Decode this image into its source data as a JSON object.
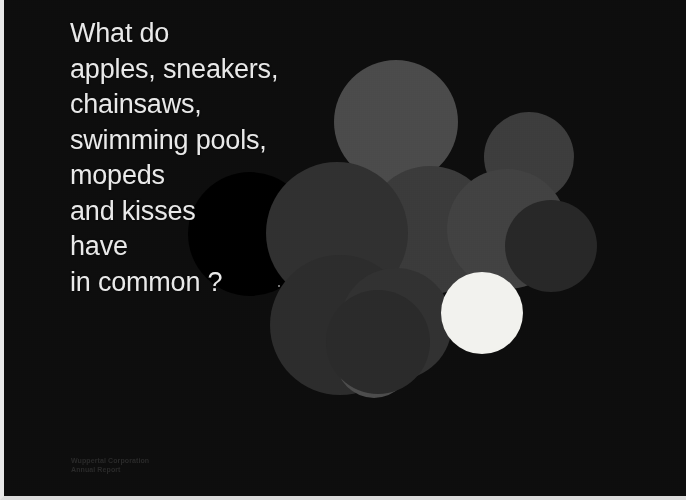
{
  "slide": {
    "background_color": "#0d0d0d",
    "border_color": "#e8e8e8",
    "headline": {
      "color": "#e9e9e9",
      "lines": [
        "What do",
        "apples, sneakers,",
        "chainsaws,",
        "swimming pools,",
        "mopeds",
        "and kisses",
        "have",
        "in common ?"
      ]
    },
    "credit": {
      "color": "#2a2a2a",
      "lines": [
        "Wuppertal Corporation",
        "Annual Report"
      ]
    },
    "bubbles": [
      {
        "name": "bubble-large-top-gray",
        "x": 330,
        "y": 60,
        "size": 124,
        "color": "#4a4a4a"
      },
      {
        "name": "bubble-upper-right-gray",
        "x": 480,
        "y": 112,
        "size": 90,
        "color": "#3c3c3c"
      },
      {
        "name": "bubble-center-gray",
        "x": 362,
        "y": 166,
        "size": 128,
        "color": "#3a3a3a"
      },
      {
        "name": "bubble-mid-right-gray",
        "x": 443,
        "y": 169,
        "size": 120,
        "color": "#414141"
      },
      {
        "name": "bubble-right-dark",
        "x": 501,
        "y": 200,
        "size": 92,
        "color": "#272727"
      },
      {
        "name": "bubble-void-black",
        "x": 184,
        "y": 172,
        "size": 124,
        "color": "#000000"
      },
      {
        "name": "bubble-left-dark",
        "x": 262,
        "y": 162,
        "size": 142,
        "color": "#303030"
      },
      {
        "name": "bubble-lower-left-dark",
        "x": 266,
        "y": 255,
        "size": 140,
        "color": "#2c2c2c"
      },
      {
        "name": "bubble-lower-center-dark",
        "x": 336,
        "y": 268,
        "size": 112,
        "color": "#313131"
      },
      {
        "name": "bubble-bottom-gray",
        "x": 332,
        "y": 322,
        "size": 76,
        "color": "#4c4c4c"
      },
      {
        "name": "bubble-bottom-dark",
        "x": 322,
        "y": 290,
        "size": 104,
        "color": "#2a2a2a"
      },
      {
        "name": "bubble-white-highlight",
        "x": 437,
        "y": 272,
        "size": 82,
        "color": "#f2f2ee"
      }
    ],
    "speck": {
      "name": "speck-dot",
      "color": "#9a9a9a"
    }
  }
}
